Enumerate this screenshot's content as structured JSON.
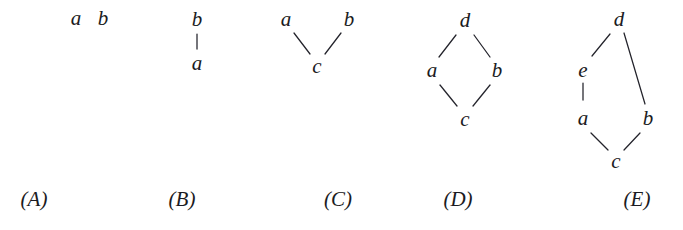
{
  "figure": {
    "background_color": "#ffffff",
    "ink_color": "#1b1b22"
  },
  "diagrams": [
    {
      "id": "A",
      "caption": "(A)",
      "caption_x": 34,
      "caption_y": 199,
      "nodes": [
        {
          "label": "a",
          "x": 76,
          "y": 18
        },
        {
          "label": "b",
          "x": 103,
          "y": 18
        }
      ],
      "edges": []
    },
    {
      "id": "B",
      "caption": "(B)",
      "caption_x": 182,
      "caption_y": 199,
      "nodes": [
        {
          "label": "b",
          "x": 197,
          "y": 19
        },
        {
          "label": "a",
          "x": 197,
          "y": 63
        }
      ],
      "edges": [
        {
          "from": "b",
          "to": "a",
          "x1": 197,
          "y1": 34,
          "x2": 197,
          "y2": 49
        }
      ]
    },
    {
      "id": "C",
      "caption": "(C)",
      "caption_x": 338,
      "caption_y": 199,
      "nodes": [
        {
          "label": "a",
          "x": 286,
          "y": 19
        },
        {
          "label": "b",
          "x": 349,
          "y": 19
        },
        {
          "label": "c",
          "x": 317,
          "y": 66
        }
      ],
      "edges": [
        {
          "from": "a",
          "to": "c",
          "x1": 294,
          "y1": 33,
          "x2": 310,
          "y2": 54
        },
        {
          "from": "b",
          "to": "c",
          "x1": 341,
          "y1": 33,
          "x2": 325,
          "y2": 54
        }
      ]
    },
    {
      "id": "D",
      "caption": "(D)",
      "caption_x": 458,
      "caption_y": 199,
      "nodes": [
        {
          "label": "d",
          "x": 465,
          "y": 20
        },
        {
          "label": "a",
          "x": 432,
          "y": 70
        },
        {
          "label": "b",
          "x": 497,
          "y": 70
        },
        {
          "label": "c",
          "x": 465,
          "y": 119
        }
      ],
      "edges": [
        {
          "from": "d",
          "to": "a",
          "x1": 456,
          "y1": 35,
          "x2": 439,
          "y2": 57
        },
        {
          "from": "d",
          "to": "b",
          "x1": 474,
          "y1": 35,
          "x2": 490,
          "y2": 57
        },
        {
          "from": "a",
          "to": "c",
          "x1": 440,
          "y1": 85,
          "x2": 457,
          "y2": 106
        },
        {
          "from": "b",
          "to": "c",
          "x1": 490,
          "y1": 85,
          "x2": 473,
          "y2": 106
        }
      ]
    },
    {
      "id": "E",
      "caption": "(E)",
      "caption_x": 637,
      "caption_y": 199,
      "nodes": [
        {
          "label": "d",
          "x": 619,
          "y": 19
        },
        {
          "label": "e",
          "x": 583,
          "y": 70
        },
        {
          "label": "a",
          "x": 583,
          "y": 118
        },
        {
          "label": "b",
          "x": 648,
          "y": 118
        },
        {
          "label": "c",
          "x": 616,
          "y": 161
        }
      ],
      "edges": [
        {
          "from": "d",
          "to": "e",
          "x1": 610,
          "y1": 34,
          "x2": 592,
          "y2": 56
        },
        {
          "from": "d",
          "to": "b",
          "x1": 624,
          "y1": 33,
          "x2": 645,
          "y2": 104
        },
        {
          "from": "e",
          "to": "a",
          "x1": 583,
          "y1": 83,
          "x2": 583,
          "y2": 100
        },
        {
          "from": "a",
          "to": "c",
          "x1": 591,
          "y1": 133,
          "x2": 608,
          "y2": 150
        },
        {
          "from": "b",
          "to": "c",
          "x1": 640,
          "y1": 133,
          "x2": 624,
          "y2": 150
        }
      ]
    }
  ]
}
